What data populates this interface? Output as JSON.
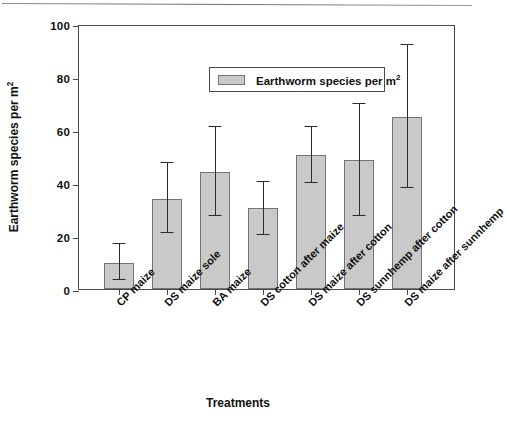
{
  "chart_data": {
    "type": "bar",
    "title": "",
    "xlabel": "Treatments",
    "ylabel": "Earthworm species per m²",
    "ylim": [
      0,
      100
    ],
    "yticks": [
      0,
      20,
      40,
      60,
      80,
      100
    ],
    "grid": false,
    "legend_position": "top-center-inside",
    "legend_entries": [
      "Earthworm species per m²"
    ],
    "categories": [
      "CP maize",
      "DS maize sole",
      "BA maize",
      "DS cotton after maize",
      "DS maize after cotton",
      "DS sunnhemp after cotton",
      "DS maize after sunnhemp"
    ],
    "series": [
      {
        "name": "Earthworm species per m²",
        "values": [
          10.0,
          34.0,
          44.0,
          30.5,
          50.5,
          48.5,
          65.0
        ],
        "error_upper": [
          17.0,
          47.5,
          61.0,
          40.5,
          61.0,
          70.0,
          92.0
        ],
        "error_lower": [
          3.5,
          21.0,
          27.5,
          20.5,
          40.0,
          27.5,
          38.0
        ]
      }
    ]
  },
  "axis": {
    "y_title": "Earthworm species per m",
    "y_title_sup": "2",
    "x_title": "Treatments",
    "tick_labels_y": [
      "100",
      "80",
      "60",
      "40",
      "20",
      "0"
    ]
  },
  "legend": {
    "label_text": "Earthworm species per m",
    "label_sup": "2"
  },
  "colors": {
    "bar_fill": "#c9c9c9",
    "bar_stroke": "#737373",
    "axis": "#4a4a4a",
    "error_bar": "#2b2b2b",
    "text": "#111111",
    "background": "#ffffff"
  }
}
